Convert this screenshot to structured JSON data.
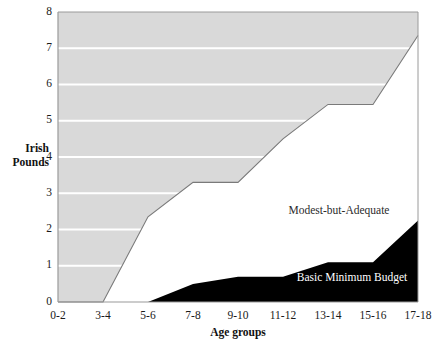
{
  "chart_data": {
    "type": "area",
    "title": "",
    "xlabel": "Age groups",
    "ylabel": "Irish Pounds",
    "ylabel_line1": "Irish",
    "ylabel_line2": "Pounds",
    "categories": [
      "0-2",
      "3-4",
      "5-6",
      "7-8",
      "9-10",
      "11-12",
      "13-14",
      "15-16",
      "17-18"
    ],
    "ylim": [
      0,
      8
    ],
    "xlim_categories": 9,
    "yticks": [
      0,
      1,
      2,
      3,
      4,
      5,
      6,
      7,
      8
    ],
    "ytick_labels": [
      "0",
      "1",
      "2",
      "3",
      "4",
      "5",
      "6",
      "7",
      "8"
    ],
    "grid": true,
    "grid_color": "#ffffff",
    "legend_position": "inline-annotations",
    "series": [
      {
        "name": "Modest-but-Adequate",
        "label": "Modest-but-Adequate",
        "fill_style": "area-above-line-shaded",
        "color": "#d8d8d8",
        "line_color": "#7a7a7a",
        "values": [
          0,
          0,
          2.35,
          3.3,
          3.3,
          4.5,
          5.45,
          5.45,
          7.35
        ]
      },
      {
        "name": "Basic Minimum Budget",
        "label": "Basic Minimum Budget",
        "fill_style": "area-below-line-solid",
        "color": "#000000",
        "line_color": "#000000",
        "values": [
          0,
          0,
          0,
          0.5,
          0.7,
          0.7,
          1.1,
          1.1,
          2.25
        ]
      }
    ],
    "annotations": [
      {
        "text": "Modest-but-Adequate",
        "x_category": "11-12",
        "y_value": 2.2,
        "color": "#2b2b2b"
      },
      {
        "text": "Basic Minimum Budget",
        "x_category": "13-14",
        "y_value": 0.78,
        "color": "#ffffff"
      }
    ],
    "axis_color": "#9a9a9a",
    "plot_background": "#ffffff"
  }
}
